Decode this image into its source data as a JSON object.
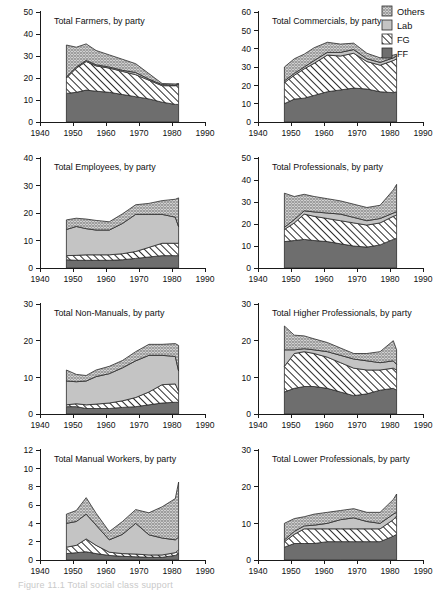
{
  "figure": {
    "caption_fragment": "Figure 11.1  Total social class support",
    "legend": {
      "position": "top-right",
      "entries": [
        {
          "label": "Others",
          "pattern": "crosshatch",
          "color": "#d8d8d8"
        },
        {
          "label": "Lab",
          "pattern": "solid",
          "color": "#c4c4c4"
        },
        {
          "label": "FG",
          "pattern": "diagonal-hatch",
          "color": "#ffffff"
        },
        {
          "label": "FF",
          "pattern": "solid",
          "color": "#6e6e6e"
        }
      ]
    }
  },
  "chart_data": [
    {
      "type": "area",
      "title": "Total Farmers, by party",
      "xlabel": "",
      "ylabel": "",
      "xlim": [
        1940,
        1990
      ],
      "ylim": [
        0,
        50
      ],
      "xticks": [
        1940,
        1950,
        1960,
        1970,
        1980,
        1990
      ],
      "yticks": [
        0,
        10,
        20,
        30,
        40,
        50
      ],
      "grid": false,
      "stacked": true,
      "x": [
        1948,
        1951,
        1954,
        1957,
        1961,
        1965,
        1969,
        1973,
        1977,
        1981,
        1982
      ],
      "series": [
        {
          "name": "FF",
          "values": [
            13.0,
            13.5,
            14.5,
            14.0,
            13.5,
            12.5,
            11.5,
            10.5,
            9.0,
            8.0,
            8.0
          ]
        },
        {
          "name": "FG",
          "values": [
            7.0,
            11.0,
            13.0,
            11.5,
            11.0,
            10.5,
            10.0,
            8.5,
            7.5,
            8.5,
            9.0
          ]
        },
        {
          "name": "Lab",
          "values": [
            0.5,
            0.5,
            0.5,
            0.5,
            0.5,
            0.5,
            1.0,
            0.5,
            0.5,
            0.3,
            0.3
          ]
        },
        {
          "name": "Others",
          "values": [
            14.5,
            9.0,
            7.5,
            6.5,
            5.5,
            5.0,
            4.0,
            2.5,
            0.5,
            0.5,
            0.2
          ]
        }
      ]
    },
    {
      "type": "area",
      "title": "Total Commercials, by party",
      "xlabel": "",
      "ylabel": "",
      "xlim": [
        1940,
        1990
      ],
      "ylim": [
        0,
        60
      ],
      "xticks": [
        1940,
        1950,
        1960,
        1970,
        1980,
        1990
      ],
      "yticks": [
        0,
        10,
        20,
        30,
        40,
        50,
        60
      ],
      "grid": false,
      "stacked": true,
      "x": [
        1948,
        1951,
        1954,
        1957,
        1961,
        1965,
        1969,
        1973,
        1977,
        1981,
        1982
      ],
      "series": [
        {
          "name": "FF",
          "values": [
            10.0,
            12.5,
            13.0,
            14.5,
            16.5,
            17.5,
            18.5,
            18.0,
            16.5,
            16.0,
            16.5
          ]
        },
        {
          "name": "FG",
          "values": [
            11.5,
            13.0,
            16.0,
            17.5,
            20.0,
            18.5,
            19.0,
            15.0,
            14.5,
            17.5,
            18.0
          ]
        },
        {
          "name": "Lab",
          "values": [
            1.0,
            1.0,
            1.0,
            1.5,
            1.5,
            2.0,
            2.0,
            1.5,
            1.5,
            1.5,
            1.5
          ]
        },
        {
          "name": "Others",
          "values": [
            7.5,
            8.0,
            7.0,
            7.0,
            5.5,
            4.5,
            3.5,
            3.0,
            2.5,
            1.5,
            1.0
          ]
        }
      ]
    },
    {
      "type": "area",
      "title": "Total Employees, by party",
      "xlabel": "",
      "ylabel": "",
      "xlim": [
        1940,
        1990
      ],
      "ylim": [
        0,
        40
      ],
      "xticks": [
        1940,
        1950,
        1960,
        1970,
        1980,
        1990
      ],
      "yticks": [
        0,
        10,
        20,
        30,
        40
      ],
      "grid": false,
      "stacked": true,
      "x": [
        1948,
        1951,
        1954,
        1957,
        1961,
        1965,
        1969,
        1973,
        1977,
        1981,
        1982
      ],
      "series": [
        {
          "name": "FF",
          "values": [
            3.0,
            2.8,
            2.8,
            2.8,
            2.8,
            3.0,
            3.5,
            4.0,
            4.5,
            4.5,
            4.5
          ]
        },
        {
          "name": "FG",
          "values": [
            1.5,
            1.8,
            2.0,
            2.0,
            2.0,
            2.2,
            2.5,
            3.5,
            4.5,
            4.5,
            4.5
          ]
        },
        {
          "name": "Lab",
          "values": [
            9.5,
            10.5,
            9.5,
            9.0,
            9.0,
            11.0,
            13.5,
            12.0,
            10.5,
            9.5,
            6.0
          ]
        },
        {
          "name": "Others",
          "values": [
            3.5,
            3.0,
            3.5,
            3.5,
            3.0,
            3.5,
            3.5,
            4.0,
            5.0,
            6.5,
            10.5
          ]
        }
      ]
    },
    {
      "type": "area",
      "title": "Total Professionals, by party",
      "xlabel": "",
      "ylabel": "",
      "xlim": [
        1940,
        1990
      ],
      "ylim": [
        0,
        50
      ],
      "xticks": [
        1940,
        1950,
        1960,
        1970,
        1980,
        1990
      ],
      "yticks": [
        0,
        10,
        20,
        30,
        40,
        50
      ],
      "grid": false,
      "stacked": true,
      "x": [
        1948,
        1951,
        1954,
        1957,
        1961,
        1965,
        1969,
        1973,
        1977,
        1981,
        1982
      ],
      "series": [
        {
          "name": "FF",
          "values": [
            12.0,
            12.5,
            13.0,
            12.5,
            12.0,
            11.0,
            10.0,
            9.5,
            10.5,
            13.0,
            13.5
          ]
        },
        {
          "name": "FG",
          "values": [
            5.5,
            8.0,
            11.5,
            11.0,
            10.5,
            10.5,
            10.5,
            10.0,
            10.0,
            10.5,
            10.5
          ]
        },
        {
          "name": "Lab",
          "values": [
            1.0,
            1.5,
            1.5,
            2.0,
            2.5,
            3.0,
            2.5,
            2.0,
            2.0,
            1.5,
            1.5
          ]
        },
        {
          "name": "Others",
          "values": [
            15.5,
            10.5,
            7.5,
            7.0,
            6.5,
            6.0,
            6.0,
            6.0,
            6.0,
            10.5,
            12.5
          ]
        }
      ]
    },
    {
      "type": "area",
      "title": "Total Non-Manuals, by party",
      "xlabel": "",
      "ylabel": "",
      "xlim": [
        1940,
        1990
      ],
      "ylim": [
        0,
        30
      ],
      "xticks": [
        1940,
        1950,
        1960,
        1970,
        1980,
        1990
      ],
      "yticks": [
        0,
        10,
        20,
        30
      ],
      "grid": false,
      "stacked": true,
      "x": [
        1948,
        1951,
        1954,
        1957,
        1961,
        1965,
        1969,
        1973,
        1977,
        1981,
        1982
      ],
      "series": [
        {
          "name": "FF",
          "values": [
            2.0,
            2.0,
            1.5,
            1.5,
            1.5,
            1.8,
            2.0,
            2.5,
            3.0,
            3.2,
            3.2
          ]
        },
        {
          "name": "FG",
          "values": [
            0.5,
            0.8,
            1.0,
            1.2,
            1.5,
            1.8,
            2.5,
            3.5,
            5.0,
            5.0,
            3.0
          ]
        },
        {
          "name": "Lab",
          "values": [
            6.5,
            6.0,
            6.5,
            7.5,
            8.0,
            9.0,
            10.0,
            10.0,
            8.0,
            7.5,
            5.5
          ]
        },
        {
          "name": "Others",
          "values": [
            3.0,
            2.0,
            1.5,
            1.8,
            2.0,
            2.0,
            2.5,
            3.0,
            3.0,
            3.5,
            7.0
          ]
        }
      ]
    },
    {
      "type": "area",
      "title": "Total Higher Professionals, by party",
      "xlabel": "",
      "ylabel": "",
      "xlim": [
        1940,
        1990
      ],
      "ylim": [
        0,
        30
      ],
      "xticks": [
        1940,
        1950,
        1960,
        1970,
        1980,
        1990
      ],
      "yticks": [
        0,
        10,
        20,
        30
      ],
      "grid": false,
      "stacked": true,
      "x": [
        1948,
        1951,
        1954,
        1957,
        1961,
        1965,
        1969,
        1973,
        1977,
        1981,
        1982
      ],
      "series": [
        {
          "name": "FF",
          "values": [
            6.0,
            7.0,
            7.5,
            7.5,
            7.0,
            6.0,
            5.0,
            5.5,
            6.5,
            7.0,
            6.5
          ]
        },
        {
          "name": "FG",
          "values": [
            7.0,
            9.5,
            9.5,
            9.0,
            8.5,
            8.0,
            7.5,
            6.5,
            5.5,
            5.5,
            5.5
          ]
        },
        {
          "name": "Lab",
          "values": [
            4.5,
            1.0,
            0.8,
            1.0,
            1.5,
            2.0,
            2.5,
            2.5,
            2.0,
            2.0,
            1.5
          ]
        },
        {
          "name": "Others",
          "values": [
            6.5,
            4.0,
            3.5,
            3.0,
            2.5,
            2.0,
            1.5,
            2.0,
            3.0,
            5.5,
            4.0
          ]
        }
      ]
    },
    {
      "type": "area",
      "title": "Total Manual Workers, by party",
      "xlabel": "",
      "ylabel": "",
      "xlim": [
        1940,
        1990
      ],
      "ylim": [
        0,
        12
      ],
      "xticks": [
        1940,
        1950,
        1960,
        1970,
        1980,
        1990
      ],
      "yticks": [
        0,
        2,
        4,
        6,
        8,
        10,
        12
      ],
      "grid": false,
      "stacked": true,
      "x": [
        1948,
        1951,
        1954,
        1957,
        1961,
        1965,
        1969,
        1973,
        1977,
        1981,
        1982
      ],
      "series": [
        {
          "name": "FF",
          "values": [
            0.7,
            0.8,
            0.9,
            0.7,
            0.5,
            0.4,
            0.35,
            0.3,
            0.3,
            0.5,
            0.7
          ]
        },
        {
          "name": "FG",
          "values": [
            0.7,
            0.8,
            1.4,
            0.9,
            0.35,
            0.3,
            0.3,
            0.25,
            0.25,
            0.3,
            0.4
          ]
        },
        {
          "name": "Lab",
          "values": [
            2.6,
            2.6,
            2.7,
            2.2,
            1.35,
            2.1,
            3.35,
            2.2,
            1.85,
            1.4,
            1.4
          ]
        },
        {
          "name": "Others",
          "values": [
            1.0,
            1.2,
            1.8,
            1.3,
            0.9,
            1.4,
            1.5,
            2.4,
            3.4,
            4.5,
            6.0
          ]
        }
      ]
    },
    {
      "type": "area",
      "title": "Total Lower Professionals, by party",
      "xlabel": "",
      "ylabel": "",
      "xlim": [
        1940,
        1990
      ],
      "ylim": [
        0,
        30
      ],
      "xticks": [
        1940,
        1950,
        1960,
        1970,
        1980,
        1990
      ],
      "yticks": [
        0,
        10,
        20,
        30
      ],
      "grid": false,
      "stacked": true,
      "x": [
        1948,
        1951,
        1954,
        1957,
        1961,
        1965,
        1969,
        1973,
        1977,
        1981,
        1982
      ],
      "series": [
        {
          "name": "FF",
          "values": [
            3.5,
            4.5,
            4.5,
            4.5,
            5.0,
            5.0,
            5.0,
            5.0,
            5.0,
            6.5,
            7.0
          ]
        },
        {
          "name": "FG",
          "values": [
            1.5,
            2.5,
            4.0,
            4.0,
            3.5,
            3.5,
            3.5,
            3.5,
            3.5,
            4.5,
            5.0
          ]
        },
        {
          "name": "Lab",
          "values": [
            0.5,
            0.8,
            0.8,
            1.0,
            1.5,
            2.5,
            3.0,
            2.0,
            1.5,
            1.5,
            1.0
          ]
        },
        {
          "name": "Others",
          "values": [
            4.5,
            3.5,
            2.5,
            3.0,
            3.0,
            2.5,
            2.5,
            2.5,
            3.0,
            4.0,
            5.0
          ]
        }
      ]
    }
  ]
}
